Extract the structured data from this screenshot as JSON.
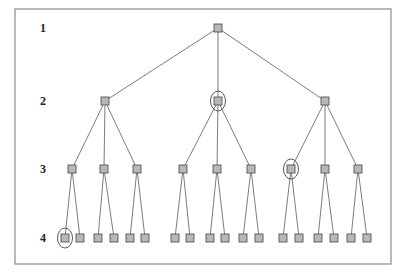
{
  "diagram": {
    "type": "tree",
    "frame": {
      "x": 15,
      "y": 9,
      "w": 376,
      "h": 255
    },
    "colors": {
      "node_fill": "#b8b8b8",
      "node_stroke": "#555555",
      "edge": "#5a5a5a",
      "frame": "#8a8a8a"
    },
    "levels": [
      {
        "label": "1",
        "y": 28
      },
      {
        "label": "2",
        "y": 101
      },
      {
        "label": "3",
        "y": 169
      },
      {
        "label": "4",
        "y": 238
      }
    ],
    "nodes": [
      {
        "id": "n1",
        "level": 1,
        "x": 218,
        "parent": null
      },
      {
        "id": "n2a",
        "level": 2,
        "x": 105,
        "parent": "n1"
      },
      {
        "id": "n2b",
        "level": 2,
        "x": 218,
        "parent": "n1",
        "highlighted": true
      },
      {
        "id": "n2c",
        "level": 2,
        "x": 325,
        "parent": "n1"
      },
      {
        "id": "n3a",
        "level": 3,
        "x": 72,
        "parent": "n2a"
      },
      {
        "id": "n3b",
        "level": 3,
        "x": 104,
        "parent": "n2a"
      },
      {
        "id": "n3c",
        "level": 3,
        "x": 137,
        "parent": "n2a"
      },
      {
        "id": "n3d",
        "level": 3,
        "x": 183,
        "parent": "n2b"
      },
      {
        "id": "n3e",
        "level": 3,
        "x": 217,
        "parent": "n2b"
      },
      {
        "id": "n3f",
        "level": 3,
        "x": 251,
        "parent": "n2b"
      },
      {
        "id": "n3g",
        "level": 3,
        "x": 291,
        "parent": "n2c",
        "highlighted": true
      },
      {
        "id": "n3h",
        "level": 3,
        "x": 325,
        "parent": "n2c"
      },
      {
        "id": "n3i",
        "level": 3,
        "x": 358,
        "parent": "n2c"
      },
      {
        "id": "n4a",
        "level": 4,
        "x": 65,
        "parent": "n3a",
        "highlighted": true
      },
      {
        "id": "n4b",
        "level": 4,
        "x": 80,
        "parent": "n3a"
      },
      {
        "id": "n4c",
        "level": 4,
        "x": 98,
        "parent": "n3b"
      },
      {
        "id": "n4d",
        "level": 4,
        "x": 114,
        "parent": "n3b"
      },
      {
        "id": "n4e",
        "level": 4,
        "x": 130,
        "parent": "n3c"
      },
      {
        "id": "n4f",
        "level": 4,
        "x": 145,
        "parent": "n3c"
      },
      {
        "id": "n4g",
        "level": 4,
        "x": 175,
        "parent": "n3d"
      },
      {
        "id": "n4h",
        "level": 4,
        "x": 190,
        "parent": "n3d"
      },
      {
        "id": "n4i",
        "level": 4,
        "x": 210,
        "parent": "n3e"
      },
      {
        "id": "n4j",
        "level": 4,
        "x": 225,
        "parent": "n3e"
      },
      {
        "id": "n4k",
        "level": 4,
        "x": 243,
        "parent": "n3f"
      },
      {
        "id": "n4l",
        "level": 4,
        "x": 259,
        "parent": "n3f"
      },
      {
        "id": "n4m",
        "level": 4,
        "x": 283,
        "parent": "n3g"
      },
      {
        "id": "n4n",
        "level": 4,
        "x": 299,
        "parent": "n3g"
      },
      {
        "id": "n4o",
        "level": 4,
        "x": 318,
        "parent": "n3h"
      },
      {
        "id": "n4p",
        "level": 4,
        "x": 334,
        "parent": "n3h"
      },
      {
        "id": "n4q",
        "level": 4,
        "x": 351,
        "parent": "n3i"
      },
      {
        "id": "n4r",
        "level": 4,
        "x": 367,
        "parent": "n3i"
      }
    ]
  }
}
